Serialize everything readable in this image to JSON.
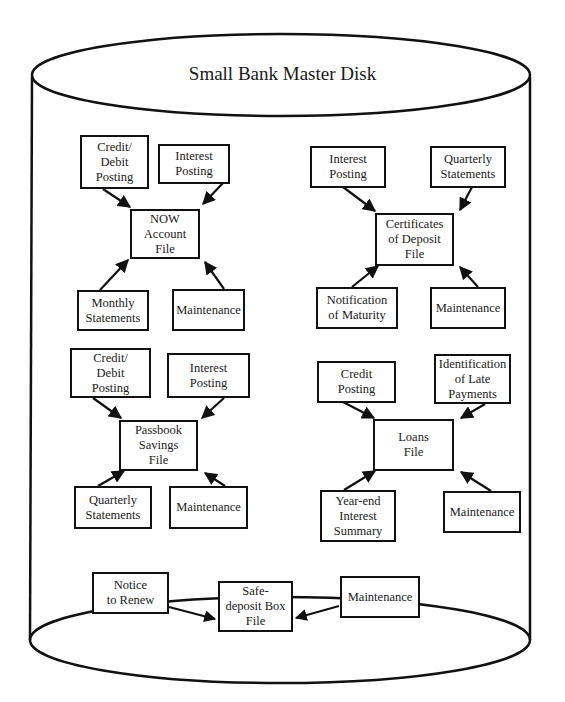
{
  "title": "Small Bank Master Disk",
  "groups": {
    "now": {
      "file": "NOW\nAccount\nFile",
      "inputs": [
        "Credit/\nDebit\nPosting",
        "Interest\nPosting",
        "Monthly\nStatements",
        "Maintenance"
      ]
    },
    "cd": {
      "file": "Certificates\nof Deposit\nFile",
      "inputs": [
        "Interest\nPosting",
        "Quarterly\nStatements",
        "Notification\nof Maturity",
        "Maintenance"
      ]
    },
    "passbook": {
      "file": "Passbook\nSavings\nFile",
      "inputs": [
        "Credit/\nDebit\nPosting",
        "Interest\nPosting",
        "Quarterly\nStatements",
        "Maintenance"
      ]
    },
    "loans": {
      "file": "Loans\nFile",
      "inputs": [
        "Credit\nPosting",
        "Identification\nof Late\nPayments",
        "Year-end\nInterest\nSummary",
        "Maintenance"
      ]
    },
    "safedeposit": {
      "file": "Safe-\ndeposit Box\nFile",
      "inputs": [
        "Notice\nto Renew",
        "Maintenance"
      ]
    }
  }
}
